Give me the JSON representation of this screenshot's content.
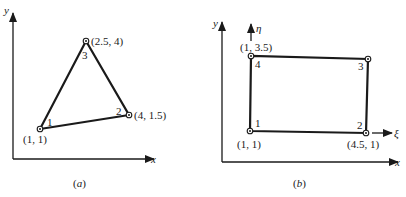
{
  "figure_a": {
    "caption": "(a)",
    "x_axis_label": "x",
    "y_axis_label": "y",
    "element_type": "triangle",
    "nodes": [
      {
        "id": "1",
        "coord_label": "(1, 1)",
        "x": 1,
        "y": 1
      },
      {
        "id": "2",
        "coord_label": "(4, 1.5)",
        "x": 4,
        "y": 1.5
      },
      {
        "id": "3",
        "coord_label": "(2.5, 4)",
        "x": 2.5,
        "y": 4
      }
    ]
  },
  "figure_b": {
    "caption": "(b)",
    "x_axis_label": "x",
    "y_axis_label": "y",
    "local_xi_label": "ξ",
    "local_eta_label": "η",
    "element_type": "rectangle",
    "nodes": [
      {
        "id": "1",
        "coord_label": "(1, 1)",
        "x": 1,
        "y": 1
      },
      {
        "id": "2",
        "coord_label": "(4.5, 1)",
        "x": 4.5,
        "y": 1
      },
      {
        "id": "3",
        "coord_label": "",
        "x": 4.5,
        "y": 3.5
      },
      {
        "id": "4",
        "coord_label": "(1, 3.5)",
        "x": 1,
        "y": 3.5
      }
    ]
  },
  "colors": {
    "ink": "#1a1a1a",
    "background": "#ffffff"
  }
}
